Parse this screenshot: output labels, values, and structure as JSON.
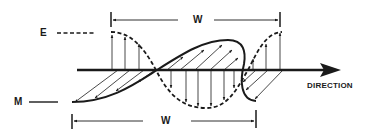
{
  "figure": {
    "type": "electromagnetic wave propagation diagram",
    "labels": {
      "electric_field": "E",
      "magnetic_field": "M",
      "wavelength_top": "W",
      "wavelength_bottom": "W",
      "direction": "DIRECTION"
    },
    "legend": [
      {
        "label": "E",
        "line_style": "dashed",
        "meaning": "electric field"
      },
      {
        "label": "M",
        "line_style": "solid",
        "meaning": "magnetic field"
      }
    ],
    "colors": {
      "ink": "#1a1a1a",
      "background": "#ffffff"
    }
  }
}
